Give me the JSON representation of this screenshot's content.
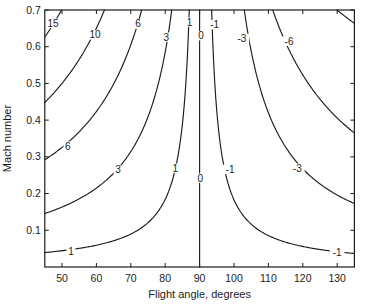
{
  "figure": {
    "background": "#ffffff",
    "ink_color": "#1c1c1c",
    "width": 372,
    "height": 308
  },
  "chart_data": {
    "type": "contour",
    "title": "",
    "xlabel": "Flight angle, degrees",
    "ylabel": "Mach number",
    "xlim": [
      45,
      135
    ],
    "ylim": [
      0,
      0.7
    ],
    "xticks": [
      50,
      60,
      70,
      80,
      90,
      100,
      110,
      120,
      130
    ],
    "yticks": [
      0.1,
      0.2,
      0.3,
      0.4,
      0.5,
      0.6,
      0.7
    ],
    "grid": false,
    "legend": "none",
    "levels": [
      15,
      10,
      6,
      3,
      1,
      0,
      -1,
      -3,
      -6,
      -10
    ],
    "contour_model": "positive side: M = C/(theta_a - theta); negative side: M = C/(theta - theta_a); level 0 is a vertical line at theta = 90",
    "contours": [
      {
        "level": 15,
        "side": "pos",
        "C": 29.0,
        "theta_a": 91.3
      },
      {
        "level": 10,
        "side": "pos",
        "C": 21.6,
        "theta_a": 93.2
      },
      {
        "level": 6,
        "side": "pos",
        "C": 14.1,
        "theta_a": 93.3
      },
      {
        "level": 3,
        "side": "pos",
        "C": 6.79,
        "theta_a": 91.6
      },
      {
        "level": 1,
        "side": "pos",
        "C": 1.75,
        "theta_a": 89.5
      },
      {
        "level": 0,
        "side": "vertical",
        "theta": 90
      },
      {
        "level": -1,
        "side": "neg",
        "C": 1.61,
        "theta_a": 91.2
      },
      {
        "level": -3,
        "side": "neg",
        "C": 7.35,
        "theta_a": 92.5
      },
      {
        "level": -6,
        "side": "neg",
        "C": 18.1,
        "theta_a": 85.4
      },
      {
        "level": -10,
        "side": "neg",
        "C": 64.5,
        "theta_a": 37.8
      }
    ],
    "contour_labels": [
      {
        "text": "15",
        "theta": 47.4,
        "mach": 0.664
      },
      {
        "text": "10",
        "theta": 59.6,
        "mach": 0.632
      },
      {
        "text": "6",
        "theta": 72.1,
        "mach": 0.662
      },
      {
        "text": "3",
        "theta": 80.3,
        "mach": 0.626
      },
      {
        "text": "1",
        "theta": 87.1,
        "mach": 0.667
      },
      {
        "text": "0",
        "theta": 90.4,
        "mach": 0.63
      },
      {
        "text": "-1",
        "theta": 94.4,
        "mach": 0.66
      },
      {
        "text": "-3",
        "theta": 102.3,
        "mach": 0.622
      },
      {
        "text": "-6",
        "theta": 116.0,
        "mach": 0.615
      },
      {
        "text": "6",
        "theta": 51.7,
        "mach": 0.329
      },
      {
        "text": "3",
        "theta": 66.3,
        "mach": 0.264
      },
      {
        "text": "1",
        "theta": 82.9,
        "mach": 0.269
      },
      {
        "text": "0",
        "theta": 90.2,
        "mach": 0.242
      },
      {
        "text": "-1",
        "theta": 98.9,
        "mach": 0.266
      },
      {
        "text": "-3",
        "theta": 118.4,
        "mach": 0.269
      },
      {
        "text": "1",
        "theta": 52.6,
        "mach": 0.043
      },
      {
        "text": "-1",
        "theta": 130.0,
        "mach": 0.04
      }
    ]
  }
}
